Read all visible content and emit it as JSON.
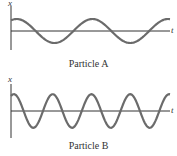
{
  "panels": [
    {
      "name": "Particle A",
      "caption": "Particle A",
      "y_axis_label": "x",
      "x_axis_label": "t",
      "cycles": 2.1,
      "amplitude_rel": 1.0
    },
    {
      "name": "Particle B",
      "caption": "Particle B",
      "y_axis_label": "x",
      "x_axis_label": "t",
      "cycles": 4.1,
      "amplitude_rel": 1.4
    }
  ],
  "colors": {
    "curve": "#6b6b6b",
    "axis": "#333333"
  }
}
